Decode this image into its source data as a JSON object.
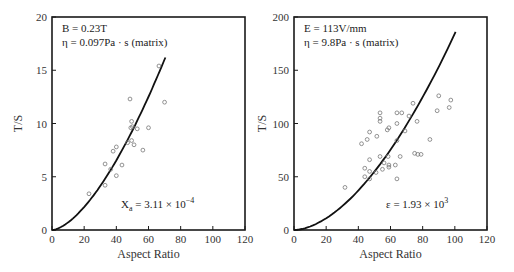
{
  "chart_data": [
    {
      "type": "scatter",
      "title": "",
      "xlabel": "Aspect Ratio",
      "ylabel": "T/S",
      "xlim": [
        0,
        120
      ],
      "ylim": [
        0,
        20
      ],
      "xticks": [
        0,
        20,
        40,
        60,
        80,
        100,
        120
      ],
      "yticks": [
        0,
        5,
        10,
        15,
        20
      ],
      "grid": false,
      "annotations": [
        "B = 0.23T",
        "η = 0.097Pa · s (matrix)",
        "X_a = 3.11 × 10^-4"
      ],
      "annotation_display": {
        "line1": "B = 0.23T",
        "line2": "η = 0.097Pa · s (matrix)",
        "fit_main": "X",
        "fit_sub": "a",
        "fit_rest": " = 3.11 × 10",
        "fit_sup": "−4"
      },
      "series": [
        {
          "name": "measured",
          "marker": "open-circle",
          "points": [
            [
              23,
              3.4
            ],
            [
              33,
              6.2
            ],
            [
              33,
              4.2
            ],
            [
              36.5,
              5.7
            ],
            [
              38,
              7.4
            ],
            [
              40,
              7.8
            ],
            [
              40,
              5.1
            ],
            [
              43.5,
              6.1
            ],
            [
              47,
              8.2
            ],
            [
              48.5,
              12.3
            ],
            [
              49,
              9.6
            ],
            [
              49.5,
              10.2
            ],
            [
              50,
              9.7
            ],
            [
              51,
              8.0
            ],
            [
              49.5,
              8.4
            ],
            [
              53,
              9.5
            ],
            [
              56.5,
              7.5
            ],
            [
              60,
              9.6
            ],
            [
              66.5,
              15.4
            ],
            [
              70,
              12.0
            ]
          ]
        },
        {
          "name": "model fit",
          "marker": "line",
          "curve": {
            "form": "power",
            "x_end": 70.5,
            "y_end": 16.2,
            "exponent": 1.6
          }
        }
      ]
    },
    {
      "type": "scatter",
      "title": "",
      "xlabel": "Aspect Ratio",
      "ylabel": "T/S",
      "xlim": [
        0,
        120
      ],
      "ylim": [
        0,
        200
      ],
      "xticks": [
        0,
        20,
        40,
        60,
        80,
        100,
        120
      ],
      "yticks": [
        0,
        50,
        100,
        150,
        200
      ],
      "grid": false,
      "annotations": [
        "E = 113V/mm",
        "η = 9.8Pa · s (matrix)",
        "ε = 1.93 × 10^3"
      ],
      "annotation_display": {
        "line1": "E = 113V/mm",
        "line2": "η = 9.8Pa · s (matrix)",
        "fit_main": "ε",
        "fit_sub": "",
        "fit_rest": " = 1.93 × 10",
        "fit_sup": "3"
      },
      "series": [
        {
          "name": "measured",
          "marker": "open-circle",
          "points": [
            [
              31.7,
              40
            ],
            [
              42,
              81
            ],
            [
              44,
              58
            ],
            [
              44,
              50
            ],
            [
              45.5,
              85
            ],
            [
              47,
              92
            ],
            [
              47,
              66
            ],
            [
              47,
              55
            ],
            [
              47,
              48
            ],
            [
              51,
              54
            ],
            [
              51.5,
              88
            ],
            [
              53.5,
              110
            ],
            [
              53.5,
              105
            ],
            [
              53.5,
              102
            ],
            [
              53.5,
              69
            ],
            [
              55,
              57
            ],
            [
              56,
              63
            ],
            [
              58,
              94
            ],
            [
              59,
              96
            ],
            [
              58.5,
              69
            ],
            [
              59,
              61
            ],
            [
              59,
              59
            ],
            [
              63,
              61
            ],
            [
              64,
              110
            ],
            [
              64,
              100
            ],
            [
              64,
              84
            ],
            [
              64,
              48
            ],
            [
              66,
              69
            ],
            [
              67,
              110
            ],
            [
              69,
              93
            ],
            [
              71.5,
              107
            ],
            [
              74,
              119
            ],
            [
              75,
              72
            ],
            [
              76.5,
              102
            ],
            [
              77,
              71
            ],
            [
              79,
              71
            ],
            [
              84.5,
              85
            ],
            [
              89,
              112
            ],
            [
              90,
              126
            ],
            [
              96.5,
              115
            ],
            [
              97.5,
              122
            ]
          ]
        },
        {
          "name": "model fit",
          "marker": "line",
          "curve": {
            "form": "power",
            "x_end": 100.5,
            "y_end": 186,
            "exponent": 1.75
          }
        }
      ]
    }
  ],
  "layout": {
    "plots": [
      {
        "left": 52,
        "top": 17,
        "right": 245,
        "bottom": 230
      },
      {
        "left": 294,
        "top": 17,
        "right": 487,
        "bottom": 230
      }
    ]
  },
  "colors": {
    "axis": "#1a1a1a",
    "curve": "#111111",
    "marker": "#777777",
    "text": "#333333"
  }
}
